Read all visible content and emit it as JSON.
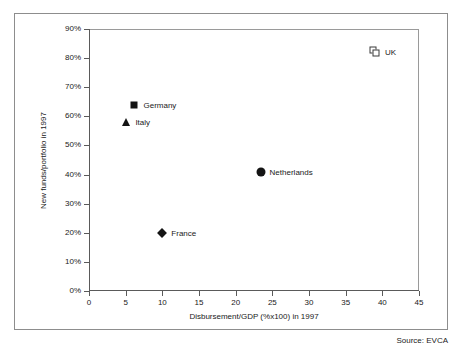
{
  "figure": {
    "source_note": "Source: EVCA"
  },
  "chart_data": {
    "type": "scatter",
    "title": "",
    "subtitle": "",
    "xlabel": "Disbursement/GDP (%x100) in 1997",
    "ylabel": "New funds/portfolio in 1997",
    "xlim": [
      0,
      45
    ],
    "ylim": [
      0,
      90
    ],
    "grid": false,
    "legend": "none (points labelled inline)",
    "xticks": [
      0,
      5,
      10,
      15,
      20,
      25,
      30,
      35,
      40,
      45
    ],
    "xticklabels": [
      "0",
      "5",
      "10",
      "15",
      "20",
      "25",
      "30",
      "35",
      "40",
      "45"
    ],
    "yticks": [
      0,
      10,
      20,
      30,
      40,
      50,
      60,
      70,
      80,
      90
    ],
    "yticklabels": [
      "0%",
      "10%",
      "20%",
      "30%",
      "40%",
      "50%",
      "60%",
      "70%",
      "80%",
      "90%"
    ],
    "points": [
      {
        "label": "UK",
        "x": 39.0,
        "y": 82,
        "marker": "open-double-square",
        "color": "#3a3a3a"
      },
      {
        "label": "Germany",
        "x": 6.2,
        "y": 64,
        "marker": "square",
        "color": "#141414"
      },
      {
        "label": "Italy",
        "x": 5.1,
        "y": 58,
        "marker": "triangle",
        "color": "#141414"
      },
      {
        "label": "Netherlands",
        "x": 23.4,
        "y": 41,
        "marker": "circle",
        "color": "#141414"
      },
      {
        "label": "France",
        "x": 10.0,
        "y": 20,
        "marker": "diamond",
        "color": "#141414"
      }
    ]
  }
}
